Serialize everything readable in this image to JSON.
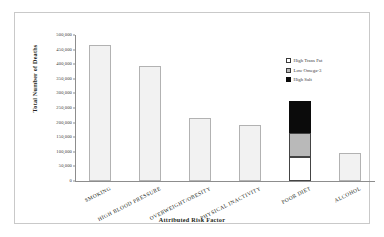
{
  "chart_data": {
    "type": "bar",
    "title": "",
    "xlabel": "Attributed Risk Factor",
    "ylabel": "Total Number of Deaths",
    "categories": [
      "SMOKING",
      "HIGH BLOOD PRESSURE",
      "OVERWEIGHT/OBESITY",
      "PHYSICAL INACTIVITY",
      "POOR DIET",
      "ALCOHOL"
    ],
    "values": [
      467000,
      395000,
      216000,
      191000,
      274000,
      96000
    ],
    "series": [
      {
        "name": "High Trans Fat",
        "values": [
          0,
          0,
          0,
          0,
          82000,
          0
        ]
      },
      {
        "name": "Low Omega-3",
        "values": [
          0,
          0,
          0,
          0,
          82000,
          0
        ]
      },
      {
        "name": "High Salt",
        "values": [
          0,
          0,
          0,
          0,
          110000,
          0
        ]
      }
    ],
    "stacked_category": "POOR DIET",
    "ylim": [
      0,
      500000
    ],
    "ytick_values": [
      0,
      50000,
      100000,
      150000,
      200000,
      250000,
      300000,
      350000,
      400000,
      450000,
      500000
    ],
    "ytick_labels": [
      "0",
      "50,000",
      "100,000",
      "150,000",
      "200,000",
      "250,000",
      "300,000",
      "350,000",
      "400,000",
      "450,000",
      "500,000"
    ],
    "grid": false,
    "legend_position": "inside-right",
    "legend": [
      {
        "label": "High Trans Fat",
        "color": "#ffffff"
      },
      {
        "label": "Low Omega-3",
        "color": "#b9b9b9"
      },
      {
        "label": "High Salt",
        "color": "#0b0b0b"
      }
    ],
    "bar_color": "#f2f2f2"
  }
}
